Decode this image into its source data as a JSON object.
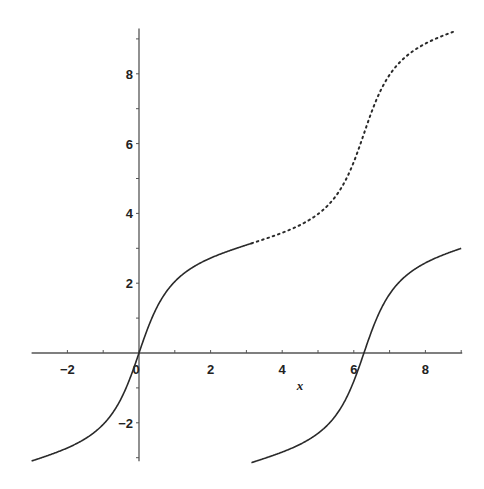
{
  "chart_data": {
    "type": "line",
    "title": "",
    "xlabel": "x",
    "ylabel": "",
    "xlim": [
      -3,
      9
    ],
    "ylim": [
      -3.1,
      9.3
    ],
    "grid": false,
    "legend": null,
    "x_ticks": [
      -2,
      0,
      2,
      4,
      6,
      8
    ],
    "x_tick_labels": [
      "-2",
      "0",
      "2",
      "4",
      "6",
      "8"
    ],
    "y_ticks": [
      -2,
      2,
      4,
      6,
      8
    ],
    "y_tick_labels": [
      "-2",
      "2",
      "4",
      "6",
      "8"
    ],
    "function": "y = 2*arctan(3*tan(x/2))",
    "series": [
      {
        "name": "principal branch (left)",
        "style": "solid",
        "x_range": [
          -3,
          3.14159
        ],
        "points": [
          [
            -3,
            -3.05
          ],
          [
            -2,
            -2.72
          ],
          [
            -1,
            -2.05
          ],
          [
            0,
            0
          ],
          [
            1,
            2.05
          ],
          [
            2,
            2.72
          ],
          [
            3.14,
            3.14
          ]
        ]
      },
      {
        "name": "principal branch (right)",
        "style": "solid",
        "x_range": [
          3.14159,
          9
        ],
        "points": [
          [
            3.14,
            -3.14
          ],
          [
            4.28,
            -2.72
          ],
          [
            5.28,
            -2.05
          ],
          [
            6.28,
            0
          ],
          [
            7.28,
            2.05
          ],
          [
            8.28,
            2.72
          ],
          [
            9,
            3.0
          ]
        ]
      },
      {
        "name": "continuous extension",
        "style": "dotted",
        "x_range": [
          3.14159,
          8.8
        ],
        "points": [
          [
            3.14,
            3.14
          ],
          [
            4.28,
            3.56
          ],
          [
            5.28,
            4.23
          ],
          [
            6.28,
            6.28
          ],
          [
            7.28,
            8.33
          ],
          [
            8.28,
            9.0
          ],
          [
            8.8,
            9.15
          ]
        ]
      }
    ]
  },
  "axes": {
    "x_axis_label": "x",
    "zero_label": "0"
  },
  "bleed_through": [
    "of Fun ……",
    "of ……",
    "by …… to ……"
  ],
  "colors": {
    "curve": "#2a2a2a",
    "axis": "#555555",
    "background": "#ffffff"
  }
}
